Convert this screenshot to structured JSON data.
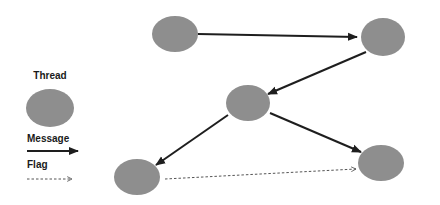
{
  "diagram": {
    "type": "thread-message-graph",
    "colors": {
      "thread_fill": "#8e8e8e",
      "message_stroke": "#1e1e1e",
      "flag_stroke": "#555555",
      "background": "#ffffff"
    },
    "legend": {
      "thread_label": "Thread",
      "message_label": "Message",
      "flag_label": "Flag"
    },
    "nodes": [
      {
        "id": "A",
        "shape": "thread"
      },
      {
        "id": "B",
        "shape": "thread"
      },
      {
        "id": "C",
        "shape": "thread"
      },
      {
        "id": "D",
        "shape": "thread"
      },
      {
        "id": "E",
        "shape": "thread"
      }
    ],
    "edges": [
      {
        "from": "A",
        "to": "B",
        "kind": "message"
      },
      {
        "from": "B",
        "to": "C",
        "kind": "message"
      },
      {
        "from": "C",
        "to": "D",
        "kind": "message"
      },
      {
        "from": "C",
        "to": "E",
        "kind": "message"
      },
      {
        "from": "D",
        "to": "E",
        "kind": "flag"
      }
    ]
  }
}
